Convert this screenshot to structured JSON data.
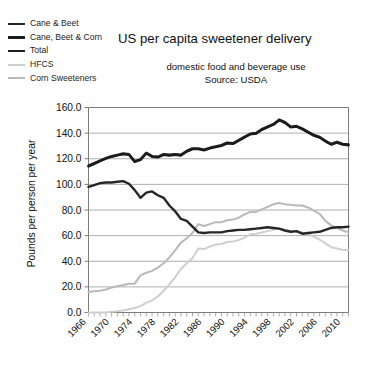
{
  "chart_data": {
    "type": "line",
    "title": "US per capita sweetener delivery",
    "subtitle": "domestic food and beverage use",
    "source": "Source: USDA",
    "xlabel": "",
    "ylabel": "Pounds per person per year",
    "ylim": [
      0.0,
      160.0
    ],
    "ytick_labels": [
      "0.0",
      "20.0",
      "40.0",
      "60.0",
      "80.0",
      "100.0",
      "120.0",
      "140.0",
      "160.0"
    ],
    "ytick_values": [
      0,
      20,
      40,
      60,
      80,
      100,
      120,
      140,
      160
    ],
    "xlim": [
      1966,
      2011
    ],
    "xtick_labels": [
      "1966",
      "1970",
      "1974",
      "1978",
      "1982",
      "1986",
      "1990",
      "1994",
      "1998",
      "2002",
      "2006",
      "2010"
    ],
    "xtick_values": [
      1966,
      1970,
      1974,
      1978,
      1982,
      1986,
      1990,
      1994,
      1998,
      2002,
      2006,
      2010
    ],
    "grid": true,
    "legend_position": "top-left",
    "x": [
      1966,
      1967,
      1968,
      1969,
      1970,
      1971,
      1972,
      1973,
      1974,
      1975,
      1976,
      1977,
      1978,
      1979,
      1980,
      1981,
      1982,
      1983,
      1984,
      1985,
      1986,
      1987,
      1988,
      1989,
      1990,
      1991,
      1992,
      1993,
      1994,
      1995,
      1996,
      1997,
      1998,
      1999,
      2000,
      2001,
      2002,
      2003,
      2004,
      2005,
      2006,
      2007,
      2008,
      2009,
      2010,
      2011
    ],
    "series": [
      {
        "name": "Total",
        "color": "#1c1c1c",
        "width": 2.6,
        "values": [
          114.5,
          116.5,
          118.5,
          120.5,
          122.0,
          123.0,
          124.0,
          123.5,
          118.0,
          119.5,
          124.5,
          122.0,
          121.5,
          123.5,
          123.0,
          123.5,
          123.0,
          126.0,
          128.0,
          128.0,
          127.0,
          128.5,
          129.5,
          130.5,
          132.5,
          132.0,
          134.5,
          137.0,
          139.5,
          140.0,
          143.0,
          145.0,
          147.0,
          150.5,
          148.5,
          145.0,
          145.5,
          143.5,
          141.0,
          138.5,
          137.0,
          134.0,
          131.5,
          133.0,
          131.5,
          131.0
        ]
      },
      {
        "name": "Cane, Beet & Corn",
        "color": "#1c1c1c",
        "width": 2.2,
        "values": [
          114.0,
          116.0,
          118.0,
          120.0,
          121.5,
          122.5,
          123.5,
          123.0,
          117.5,
          119.0,
          124.0,
          121.5,
          121.0,
          123.0,
          122.5,
          123.0,
          122.5,
          125.5,
          127.5,
          127.5,
          126.5,
          128.0,
          129.0,
          130.0,
          132.0,
          131.5,
          134.0,
          136.5,
          139.0,
          139.5,
          142.5,
          144.5,
          146.5,
          150.0,
          148.0,
          144.5,
          145.0,
          143.0,
          140.5,
          138.0,
          136.5,
          133.5,
          131.0,
          132.5,
          131.0,
          130.5
        ]
      },
      {
        "name": "Cane & Beet",
        "color": "#262626",
        "width": 2.4,
        "values": [
          98.0,
          99.5,
          101.0,
          101.5,
          101.5,
          102.0,
          102.5,
          100.5,
          95.5,
          89.5,
          93.5,
          94.5,
          91.5,
          89.5,
          83.5,
          79.0,
          73.0,
          71.5,
          67.0,
          62.5,
          62.0,
          62.5,
          62.5,
          62.5,
          63.5,
          64.0,
          64.5,
          64.5,
          65.0,
          65.5,
          66.0,
          66.5,
          66.0,
          65.5,
          64.0,
          63.0,
          63.5,
          61.5,
          62.0,
          62.5,
          63.0,
          64.5,
          66.0,
          66.5,
          66.5,
          67.0
        ]
      },
      {
        "name": "Corn Sweeteners",
        "color": "#b9b9b9",
        "width": 2.0,
        "values": [
          16.0,
          16.5,
          17.0,
          18.0,
          19.5,
          20.5,
          21.5,
          22.5,
          22.5,
          29.0,
          31.0,
          32.5,
          35.0,
          38.5,
          43.0,
          48.5,
          54.5,
          58.0,
          62.0,
          69.0,
          67.5,
          69.0,
          70.5,
          70.5,
          72.0,
          72.5,
          74.0,
          76.5,
          78.5,
          78.5,
          80.5,
          82.5,
          84.5,
          85.5,
          84.5,
          84.0,
          83.5,
          83.5,
          82.0,
          79.5,
          77.0,
          71.5,
          68.0,
          66.0,
          64.0,
          62.5
        ]
      },
      {
        "name": "HFCS",
        "color": "#cfcfcf",
        "width": 2.0,
        "values": [
          0.0,
          0.0,
          0.0,
          0.0,
          0.5,
          1.0,
          1.5,
          2.5,
          3.5,
          5.0,
          7.5,
          9.5,
          12.5,
          17.0,
          22.0,
          27.5,
          34.0,
          38.5,
          42.5,
          50.0,
          49.5,
          51.5,
          53.0,
          53.5,
          55.0,
          55.5,
          56.5,
          58.5,
          61.0,
          61.5,
          62.5,
          63.5,
          64.5,
          65.5,
          64.5,
          63.5,
          63.0,
          62.5,
          61.5,
          59.0,
          57.0,
          54.0,
          51.0,
          50.0,
          49.0,
          48.5
        ]
      }
    ]
  },
  "legend": {
    "items": [
      {
        "label": "Cane & Beet",
        "color": "#262626",
        "width": 2.4
      },
      {
        "label": "Cane, Beet & Corn",
        "color": "#1c1c1c",
        "width": 3.0
      },
      {
        "label": "Total",
        "color": "#1c1c1c",
        "width": 2.6
      },
      {
        "label": "HFCS",
        "color": "#cfcfcf",
        "width": 2.0
      },
      {
        "label": "Corn Sweeteners",
        "color": "#b9b9b9",
        "width": 2.0
      }
    ]
  }
}
